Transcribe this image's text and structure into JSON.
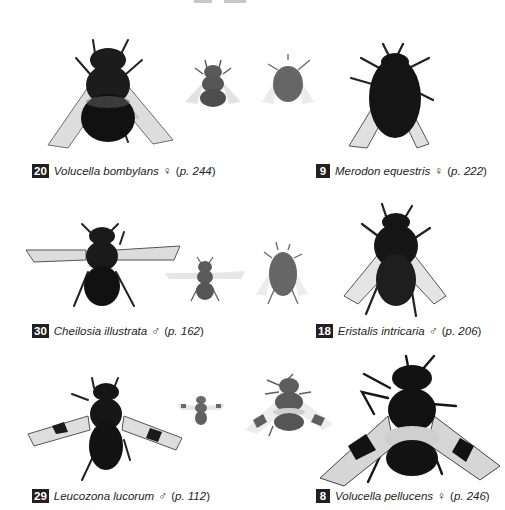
{
  "page": {
    "type": "field-guide-plate",
    "background": "#ffffff",
    "text_color": "#231f20"
  },
  "rows": [
    {
      "entries": [
        {
          "number": "20",
          "species": "Volucella bombylans",
          "sex_symbol": "♀",
          "page_prefix": "(",
          "page_ref": "p. 244",
          "page_suffix": ")"
        },
        {
          "number": "9",
          "species": "Merodon equestris",
          "sex_symbol": "♀",
          "page_prefix": "(",
          "page_ref": "p. 222",
          "page_suffix": ")"
        }
      ],
      "images": [
        {
          "label": "Volucella bombylans specimen",
          "tone": "#1c1c1c"
        },
        {
          "label": "small bee mimic 1",
          "tone": "#5a5a5a"
        },
        {
          "label": "small bee mimic 2",
          "tone": "#6a6a6a"
        },
        {
          "label": "Merodon equestris specimen",
          "tone": "#141414"
        }
      ]
    },
    {
      "entries": [
        {
          "number": "30",
          "species": "Cheilosia illustrata",
          "sex_symbol": "♂",
          "page_prefix": "(",
          "page_ref": "p. 162",
          "page_suffix": ")"
        },
        {
          "number": "18",
          "species": "Eristalis intricaria",
          "sex_symbol": "♂",
          "page_prefix": "(",
          "page_ref": "p. 206",
          "page_suffix": ")"
        }
      ],
      "images": [
        {
          "label": "Cheilosia illustrata specimen",
          "tone": "#1a1a1a"
        },
        {
          "label": "small mimic 3",
          "tone": "#5c5c5c"
        },
        {
          "label": "small mimic 4",
          "tone": "#6a6a6a"
        },
        {
          "label": "Eristalis intricaria specimen",
          "tone": "#161616"
        }
      ]
    },
    {
      "entries": [
        {
          "number": "29",
          "species": "Leucozona lucorum",
          "sex_symbol": "♂",
          "page_prefix": "(",
          "page_ref": "p. 112",
          "page_suffix": ")"
        },
        {
          "number": "8",
          "species": "Volucella pellucens",
          "sex_symbol": "♀",
          "page_prefix": "(",
          "page_ref": "p. 246",
          "page_suffix": ")"
        }
      ],
      "images": [
        {
          "label": "Leucozona lucorum specimen",
          "tone": "#161616"
        },
        {
          "label": "small mimic 5",
          "tone": "#6a6a6a"
        },
        {
          "label": "small mimic 6",
          "tone": "#5e5e5e"
        },
        {
          "label": "Volucella pellucens specimen",
          "tone": "#121212"
        }
      ]
    }
  ]
}
